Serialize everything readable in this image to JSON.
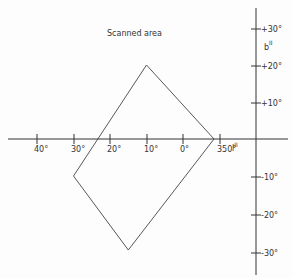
{
  "title": "Scanned area",
  "x_axis": {
    "label": "l",
    "label_superscript": "II",
    "ticks": [
      {
        "value": 40,
        "label": "40°",
        "x": 37
      },
      {
        "value": 30,
        "label": "30°",
        "x": 74
      },
      {
        "value": 20,
        "label": "20°",
        "x": 110
      },
      {
        "value": 10,
        "label": "10°",
        "x": 147
      },
      {
        "value": 0,
        "label": "0°",
        "x": 183
      },
      {
        "value": 350,
        "label": "350°",
        "x": 220
      }
    ]
  },
  "y_axis": {
    "label": "b",
    "label_superscript": "II",
    "ticks": [
      {
        "value": 30,
        "label": "+30°",
        "y": 29
      },
      {
        "value": 20,
        "label": "+20°",
        "y": 66
      },
      {
        "value": 10,
        "label": "+10°",
        "y": 103
      },
      {
        "value": -10,
        "label": "-10°",
        "y": 177
      },
      {
        "value": -20,
        "label": "-20°",
        "y": 215
      },
      {
        "value": -30,
        "label": "-30°",
        "y": 253
      }
    ]
  },
  "scanned_region": {
    "vertices_galactic": [
      {
        "l": 10,
        "b": 20
      },
      {
        "l": 351.5,
        "b": 0
      },
      {
        "l": 15,
        "b": -30
      },
      {
        "l": 30,
        "b": -10
      }
    ]
  }
}
